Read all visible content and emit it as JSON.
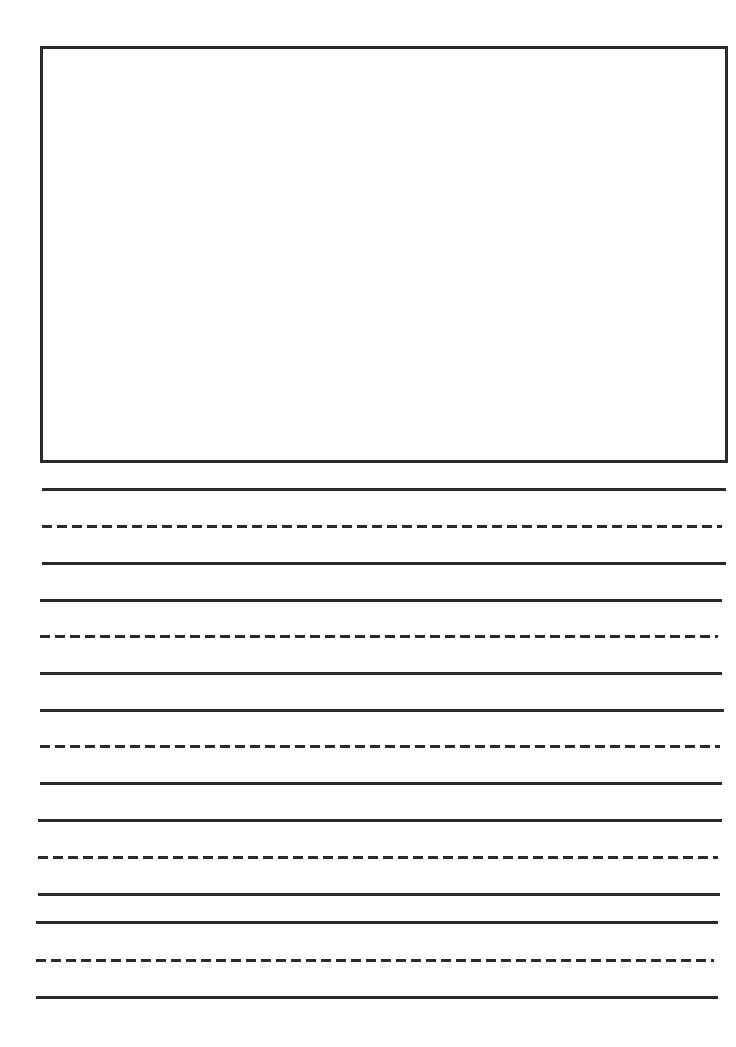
{
  "worksheet": {
    "title": "",
    "drawing_box": {
      "x": 40,
      "y": 46,
      "width": 686,
      "height": 415,
      "color": "#2a2a2a"
    },
    "line_color": "#2a2a2a",
    "lines": [
      {
        "type": "solid",
        "y": 488,
        "x1": 42,
        "x2": 726
      },
      {
        "type": "dashed",
        "y": 525,
        "x1": 42,
        "x2": 722
      },
      {
        "type": "solid",
        "y": 562,
        "x1": 42,
        "x2": 726
      },
      {
        "type": "solid",
        "y": 599,
        "x1": 40,
        "x2": 722
      },
      {
        "type": "dashed",
        "y": 635,
        "x1": 40,
        "x2": 718
      },
      {
        "type": "solid",
        "y": 672,
        "x1": 40,
        "x2": 722
      },
      {
        "type": "solid",
        "y": 709,
        "x1": 40,
        "x2": 724
      },
      {
        "type": "dashed",
        "y": 745,
        "x1": 40,
        "x2": 720
      },
      {
        "type": "solid",
        "y": 782,
        "x1": 40,
        "x2": 722
      },
      {
        "type": "solid",
        "y": 819,
        "x1": 38,
        "x2": 722
      },
      {
        "type": "dashed",
        "y": 856,
        "x1": 38,
        "x2": 718
      },
      {
        "type": "solid",
        "y": 893,
        "x1": 38,
        "x2": 720
      },
      {
        "type": "solid",
        "y": 921,
        "x1": 36,
        "x2": 718
      },
      {
        "type": "dashed",
        "y": 959,
        "x1": 36,
        "x2": 714
      },
      {
        "type": "solid",
        "y": 996,
        "x1": 36,
        "x2": 718
      }
    ]
  }
}
